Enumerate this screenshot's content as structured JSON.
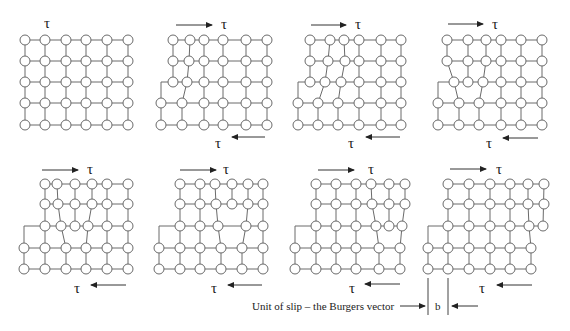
{
  "figure": {
    "stress_symbol": "τ",
    "caption": "Unit of slip – the Burgers vector",
    "burgers_label": "b",
    "colors": {
      "bonds": "#6a6a6a",
      "atoms_fill": "#ffffff",
      "text": "#222222"
    }
  },
  "panels": [
    {
      "id": 1,
      "label": "Perfect lattice, no shear",
      "top_tau": "τ",
      "bottom_tau": ""
    },
    {
      "id": 2,
      "label": "Extra half-plane enters from left",
      "top_tau": "τ",
      "bottom_tau": "τ"
    },
    {
      "id": 3,
      "label": "Dislocation moves right",
      "top_tau": "τ",
      "bottom_tau": "τ"
    },
    {
      "id": 4,
      "label": "Dislocation moves right",
      "top_tau": "τ",
      "bottom_tau": "τ"
    },
    {
      "id": 5,
      "label": "Dislocation moves right",
      "top_tau": "τ",
      "bottom_tau": "τ"
    },
    {
      "id": 6,
      "label": "Dislocation moves right",
      "top_tau": "τ",
      "bottom_tau": "τ"
    },
    {
      "id": 7,
      "label": "Dislocation near right edge",
      "top_tau": "τ",
      "bottom_tau": "τ"
    },
    {
      "id": 8,
      "label": "Dislocation exits; unit slip step",
      "top_tau": "τ",
      "bottom_tau": "τ"
    }
  ]
}
